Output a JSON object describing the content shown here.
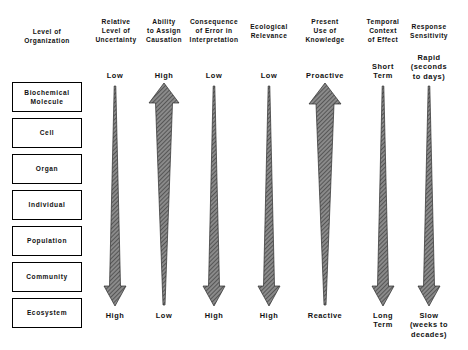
{
  "figure": {
    "background_color": "#ffffff",
    "ink_color": "#000000",
    "arrow_fill": "#6e6e6e"
  },
  "columns": [
    {
      "key": "level_of_organization",
      "header": "Level of\nOrganization",
      "type": "boxes",
      "center_x": 47
    },
    {
      "key": "relative_level_of_uncertainty",
      "header": "Relative\nLevel of\nUncertainty",
      "type": "arrow",
      "direction": "down",
      "top_label": "Low",
      "bottom_label": "High",
      "center_x": 115
    },
    {
      "key": "ability_to_assign_causation",
      "header": "Ability\nto Assign\nCausation",
      "type": "arrow",
      "direction": "up",
      "top_label": "High",
      "bottom_label": "Low",
      "center_x": 164
    },
    {
      "key": "consequence_of_error_in_interpretation",
      "header": "Consequence\nof Error in\nInterpretation",
      "type": "arrow",
      "direction": "down",
      "top_label": "Low",
      "bottom_label": "High",
      "center_x": 214
    },
    {
      "key": "ecological_relevance",
      "header": "Ecological\nRelevance",
      "type": "arrow",
      "direction": "down",
      "top_label": "Low",
      "bottom_label": "High",
      "center_x": 269
    },
    {
      "key": "present_use_of_knowledge",
      "header": "Present\nUse of\nKnowledge",
      "type": "arrow",
      "direction": "up",
      "top_label": "Proactive",
      "bottom_label": "Reactive",
      "center_x": 325
    },
    {
      "key": "temporal_context_of_effect",
      "header": "Temporal\nContext\nof Effect",
      "type": "arrow",
      "direction": "down",
      "top_label": "Short\nTerm",
      "bottom_label": "Long\nTerm",
      "center_x": 383
    },
    {
      "key": "response_sensitivity",
      "header": "Response\nSensitivity",
      "type": "arrow",
      "direction": "down",
      "top_label": "Rapid\n(seconds\nto days)",
      "bottom_label": "Slow\n(weeks to\ndecades)",
      "center_x": 429
    }
  ],
  "levels": [
    {
      "label": "Biochemical\nMolecule"
    },
    {
      "label": "Cell"
    },
    {
      "label": "Organ"
    },
    {
      "label": "Individual"
    },
    {
      "label": "Population"
    },
    {
      "label": "Community"
    },
    {
      "label": "Ecosystem"
    }
  ]
}
